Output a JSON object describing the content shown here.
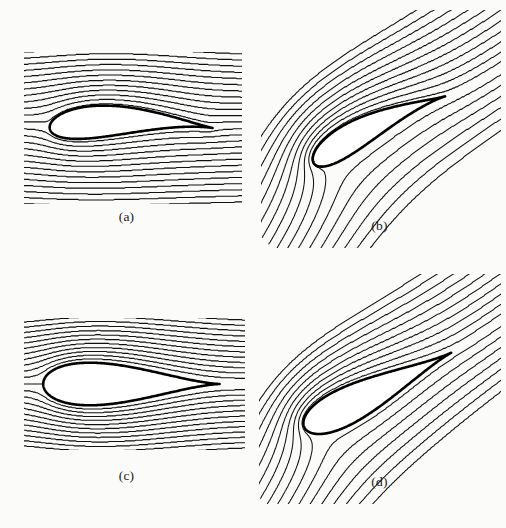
{
  "figure": {
    "kind": "streamline-plot-grid",
    "rows": 2,
    "columns": 2,
    "background_color": "#fbfbf9",
    "line_color": "#111111",
    "body_outline_color": "#000000",
    "body_fill_color": "#ffffff"
  },
  "chart_data": {
    "type": "line",
    "title": "",
    "subtitle": "",
    "xlabel": "",
    "ylabel": "",
    "grid": false,
    "legend_position": "none",
    "panels": [
      {
        "id": "a",
        "label": "(a)",
        "airfoil": "cambered",
        "angle_of_attack_deg": 0,
        "circulation": 0,
        "kutta_condition": false,
        "flow_direction_deg": 0,
        "streamline_count": 29,
        "plot_box": {
          "x": 24,
          "y": 52,
          "width": 218,
          "height": 152
        },
        "airfoil_geometry": {
          "leading_edge": [
            0.07,
            0.5
          ],
          "trailing_edge": [
            0.8,
            0.545
          ],
          "chord_fraction": 0.73,
          "max_thickness": 0.17,
          "max_camber": 0.09,
          "thickness_position": 0.3,
          "camber_position": 0.4
        },
        "stagnation_points": [
          [
            0.07,
            0.5
          ],
          [
            0.63,
            0.6
          ]
        ]
      },
      {
        "id": "b",
        "label": "(b)",
        "airfoil": "cambered",
        "angle_of_attack_deg": 0,
        "circulation": 1,
        "kutta_condition": true,
        "flow_direction_deg": -27,
        "streamline_count": 30,
        "plot_box": {
          "x": 8,
          "y": 10,
          "width": 240,
          "height": 238
        },
        "airfoil_geometry": {
          "leading_edge": [
            0.2,
            0.52
          ],
          "trailing_edge": [
            0.8,
            0.545
          ],
          "chord_fraction": 0.6,
          "max_thickness": 0.17,
          "max_camber": 0.09,
          "thickness_position": 0.3,
          "camber_position": 0.4
        },
        "stagnation_points": [
          [
            0.21,
            0.6
          ],
          [
            0.8,
            0.545
          ]
        ]
      },
      {
        "id": "c",
        "label": "(c)",
        "airfoil": "symmetric",
        "angle_of_attack_deg": 0,
        "circulation": 0,
        "kutta_condition": false,
        "flow_direction_deg": 0,
        "streamline_count": 29,
        "plot_box": {
          "x": 24,
          "y": 54,
          "width": 221,
          "height": 132
        },
        "airfoil_geometry": {
          "leading_edge": [
            0.1,
            0.5
          ],
          "trailing_edge": [
            0.87,
            0.5
          ],
          "chord_fraction": 0.77,
          "max_thickness": 0.22,
          "max_camber": 0.0,
          "thickness_position": 0.26,
          "camber_position": 0.0
        },
        "stagnation_points": [
          [
            0.1,
            0.5
          ],
          [
            0.87,
            0.5
          ]
        ]
      },
      {
        "id": "d",
        "label": "(d)",
        "airfoil": "symmetric",
        "angle_of_attack_deg": 0,
        "circulation": 1,
        "kutta_condition": true,
        "flow_direction_deg": -27,
        "streamline_count": 30,
        "plot_box": {
          "x": 6,
          "y": 10,
          "width": 242,
          "height": 230
        },
        "airfoil_geometry": {
          "leading_edge": [
            0.18,
            0.52
          ],
          "trailing_edge": [
            0.84,
            0.5
          ],
          "chord_fraction": 0.66,
          "max_thickness": 0.2,
          "max_camber": 0.0,
          "thickness_position": 0.26,
          "camber_position": 0.0
        },
        "stagnation_points": [
          [
            0.19,
            0.6
          ],
          [
            0.84,
            0.5
          ]
        ]
      }
    ]
  }
}
